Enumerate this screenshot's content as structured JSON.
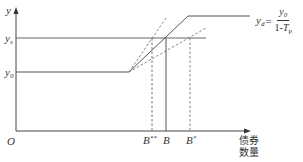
{
  "diagram": {
    "type": "economics-bond-supply-diagram",
    "colors": {
      "line": "#555555",
      "text": "#333333",
      "background": "#ffffff"
    },
    "axes": {
      "y_label": "y",
      "origin_label": "O",
      "x_label_line1": "债券",
      "x_label_line2": "数量"
    },
    "y_levels": [
      {
        "id": "y0",
        "base": "y",
        "sub": "0"
      },
      {
        "id": "ys",
        "base": "y",
        "sub": "s"
      }
    ],
    "curve_label": {
      "lhs_base": "y",
      "lhs_sub": "d",
      "equals": "=",
      "numerator_base": "y",
      "numerator_sub": "0",
      "denominator_prefix": "1-",
      "denominator_base": "T",
      "denominator_sub": "p"
    },
    "x_markers": [
      {
        "id": "B-double-star",
        "base": "B",
        "sup": "**",
        "style": "dashed"
      },
      {
        "id": "B",
        "base": "B",
        "sup": "",
        "style": "solid"
      },
      {
        "id": "B-star",
        "base": "B",
        "sup": "*",
        "style": "dashed"
      }
    ]
  }
}
